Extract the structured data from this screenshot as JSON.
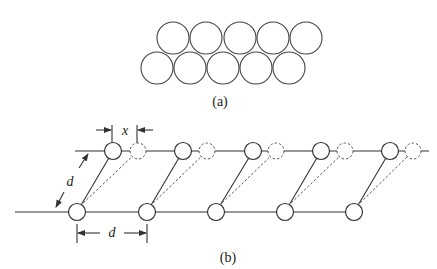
{
  "figure": {
    "panel_a": {
      "label": "(a)",
      "description": "Two staggered rows of close-packed circles",
      "top_row_count": 5,
      "bottom_row_count": 5
    },
    "panel_b": {
      "label": "(b)",
      "description": "Two parallel lines of atoms; solid circles are original positions, dashed circles are displaced positions",
      "spacing_label": "d",
      "diagonal_label": "d",
      "displacement_label": "x",
      "atoms_per_row": 5
    }
  },
  "colors": {
    "stroke": "#333333",
    "background": "#ffffff"
  }
}
